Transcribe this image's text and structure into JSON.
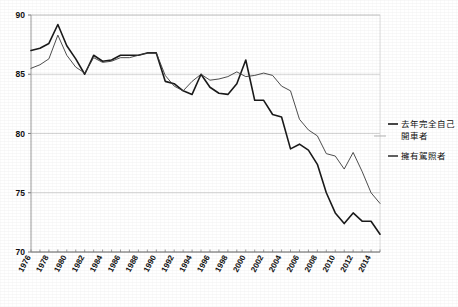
{
  "chart_data": {
    "type": "line",
    "title": "",
    "subtitle": "",
    "xlabel": "",
    "ylabel": "",
    "xlim": [
      1976,
      2015
    ],
    "ylim": [
      70,
      90
    ],
    "yticks": [
      70,
      75,
      80,
      85,
      90
    ],
    "xticks": [
      1976,
      1978,
      1980,
      1982,
      1984,
      1986,
      1988,
      1990,
      1992,
      1994,
      1996,
      1998,
      2000,
      2002,
      2004,
      2006,
      2008,
      2010,
      2012,
      2014
    ],
    "xtick_labels": [
      "1976",
      "1978",
      "1980",
      "1982",
      "1984",
      "1986",
      "1988",
      "1990",
      "1992",
      "1994",
      "1996",
      "1998",
      "2000",
      "2002",
      "2004",
      "2006",
      "2008",
      "2010",
      "2012",
      "2014"
    ],
    "ytick_labels": [
      "70",
      "75",
      "80",
      "85",
      "90"
    ],
    "grid": true,
    "grid_axis": "y",
    "legend_position": "right",
    "x": [
      1976,
      1977,
      1978,
      1979,
      1980,
      1981,
      1982,
      1983,
      1984,
      1985,
      1986,
      1987,
      1988,
      1989,
      1990,
      1991,
      1992,
      1993,
      1994,
      1995,
      1996,
      1997,
      1998,
      1999,
      2000,
      2001,
      2002,
      2003,
      2004,
      2005,
      2006,
      2007,
      2008,
      2009,
      2010,
      2011,
      2012,
      2013,
      2014,
      2015
    ],
    "series": [
      {
        "name": "去年完全自己開車者",
        "color": "#1a1a1a",
        "linewidth": 1.6,
        "values": [
          87.0,
          87.2,
          87.6,
          89.2,
          87.4,
          86.3,
          85.0,
          86.6,
          86.1,
          86.2,
          86.6,
          86.6,
          86.6,
          86.8,
          86.8,
          84.4,
          84.2,
          83.6,
          83.3,
          85.0,
          83.9,
          83.4,
          83.3,
          84.2,
          86.2,
          82.8,
          82.8,
          81.6,
          81.4,
          78.7,
          79.1,
          78.6,
          77.4,
          75.0,
          73.3,
          72.4,
          73.3,
          72.6,
          72.6,
          71.5
        ]
      },
      {
        "name": "擁有駕照者",
        "color": "#3a3a3a",
        "linewidth": 0.9,
        "values": [
          85.5,
          85.8,
          86.3,
          88.3,
          86.6,
          85.6,
          85.1,
          86.4,
          86.0,
          86.1,
          86.4,
          86.4,
          86.6,
          86.8,
          86.8,
          84.9,
          84.0,
          83.6,
          84.4,
          85.0,
          84.5,
          84.6,
          84.8,
          85.2,
          84.8,
          84.9,
          85.1,
          84.9,
          84.0,
          83.6,
          81.2,
          80.3,
          79.8,
          78.3,
          78.1,
          77.0,
          78.4,
          76.8,
          75.0,
          74.1
        ]
      }
    ],
    "legend_entries": [
      {
        "label": "去年完全自己\n開車者",
        "color": "#1a1a1a",
        "linewidth": 1.6
      },
      {
        "label": "擁有駕照者",
        "color": "#3a3a3a",
        "linewidth": 1.6
      }
    ]
  },
  "axes": {
    "y_axis_name": "y-axis",
    "x_axis_name": "x-axis"
  }
}
